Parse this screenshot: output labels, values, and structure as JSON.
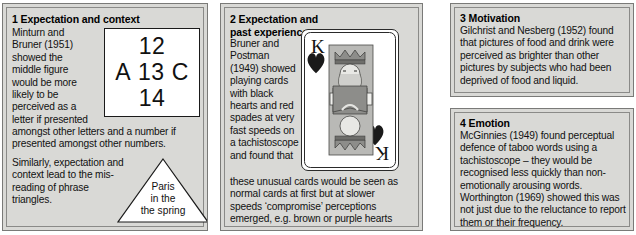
{
  "colors": {
    "panel_background": "#d9d9d6",
    "panel_border": "#7a7a78",
    "page_background": "#ffffff",
    "text": "#111111",
    "figure_background": "#ffffff",
    "card_background": "#ffffff",
    "suit_black": "#1a1a1a"
  },
  "panel1": {
    "title": "1 Expectation and context",
    "column_text": "Minturn and\nBruner (1951)\nshowed the\nmiddle figure\nwould be more\nlikely to be\nperceived as a\nletter if presented",
    "full_text": "amongst other letters and a number if\npresented amongst other numbers.",
    "full_text_2": "Similarly, expectation and\ncontext lead to the mis-\nreading of phrase\ntriangles.",
    "figure": {
      "top": "12",
      "middle_left": "A",
      "middle_center": "13",
      "middle_right": "C",
      "bottom": "14"
    },
    "triangle": {
      "line1": "Paris",
      "line2": "in the",
      "line3": "the spring"
    }
  },
  "panel2": {
    "title": "2 Expectation and past experience",
    "column_text": "Bruner and\nPostman\n(1949) showed\nplaying cards\nwith black\nhearts and red\nspades at very\nfast speeds on\na tachistoscope\nand found that",
    "full_text": "these unusual cards would be seen as\nnormal cards at first but at slower\nspeeds ‘compromise’ perceptions\nemerged, e.g. brown or purple hearts",
    "card": {
      "rank": "K",
      "suit": "hearts",
      "suit_color_shown": "black"
    }
  },
  "panel3": {
    "title": "3 Motivation",
    "text": "Gilchrist and Nesberg (1952) found\nthat pictures of food and drink were\nperceived as brighter than other\npictures by subjects who had been\ndeprived of food and liquid."
  },
  "panel4": {
    "title": "4 Emotion",
    "text": "McGinnies (1949) found perceptual\ndefence of taboo words using a\ntachistoscope – they would be\nrecognised less quickly than non-\nemotionally arousing words.\nWorthington (1969) showed this was\nnot just due to the reluctance to report\nthem or their frequency."
  }
}
